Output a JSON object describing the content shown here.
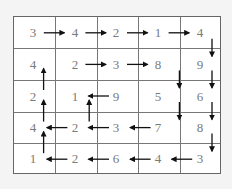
{
  "grid": {
    "rows": 5,
    "cols": 5,
    "values": [
      [
        "3",
        "4",
        "2",
        "1",
        "4"
      ],
      [
        "4",
        "2",
        "3",
        "8",
        "9"
      ],
      [
        "2",
        "1",
        "9",
        "5",
        "6"
      ],
      [
        "4",
        "2",
        "3",
        "7",
        "8"
      ],
      [
        "1",
        "2",
        "6",
        "4",
        "3"
      ]
    ],
    "arrows": [
      {
        "from": [
          0,
          0
        ],
        "dir": "right"
      },
      {
        "from": [
          0,
          1
        ],
        "dir": "right"
      },
      {
        "from": [
          0,
          2
        ],
        "dir": "right"
      },
      {
        "from": [
          0,
          3
        ],
        "dir": "right"
      },
      {
        "from": [
          0,
          4
        ],
        "dir": "down"
      },
      {
        "from": [
          1,
          0
        ],
        "dir": "up"
      },
      {
        "from": [
          1,
          1
        ],
        "dir": "right"
      },
      {
        "from": [
          1,
          2
        ],
        "dir": "right"
      },
      {
        "from": [
          1,
          3
        ],
        "dir": "down"
      },
      {
        "from": [
          1,
          4
        ],
        "dir": "down"
      },
      {
        "from": [
          2,
          0
        ],
        "dir": "up"
      },
      {
        "from": [
          2,
          1
        ],
        "dir": "up"
      },
      {
        "from": [
          2,
          2
        ],
        "dir": "left"
      },
      {
        "from": [
          2,
          3
        ],
        "dir": "down"
      },
      {
        "from": [
          2,
          4
        ],
        "dir": "down"
      },
      {
        "from": [
          3,
          0
        ],
        "dir": "up"
      },
      {
        "from": [
          3,
          1
        ],
        "dir": "left"
      },
      {
        "from": [
          3,
          2
        ],
        "dir": "left"
      },
      {
        "from": [
          3,
          3
        ],
        "dir": "left"
      },
      {
        "from": [
          3,
          4
        ],
        "dir": "down"
      },
      {
        "from": [
          4,
          1
        ],
        "dir": "left"
      },
      {
        "from": [
          4,
          2
        ],
        "dir": "left"
      },
      {
        "from": [
          4,
          3
        ],
        "dir": "left"
      },
      {
        "from": [
          4,
          4
        ],
        "dir": "left"
      }
    ]
  },
  "colors": {
    "number": "#7a7a7a",
    "arrow": "#111111",
    "line": "#777777",
    "background": "#ffffff"
  }
}
